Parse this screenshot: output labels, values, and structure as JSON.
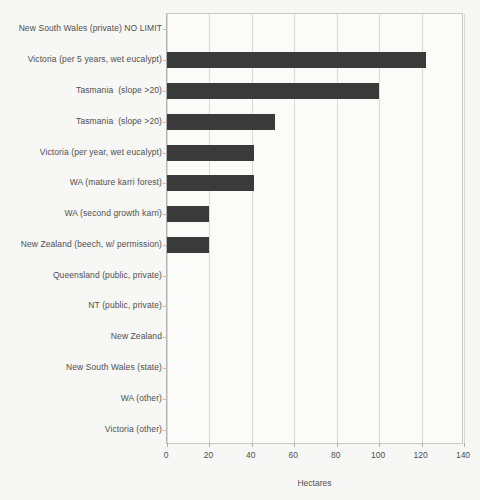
{
  "chart_data": {
    "type": "bar",
    "orientation": "horizontal",
    "title": "",
    "xlabel": "Hectares",
    "ylabel": "",
    "xlim": [
      0,
      140
    ],
    "xticks": [
      "0",
      "20",
      "40",
      "60",
      "80",
      "100",
      "120",
      "140"
    ],
    "xtick_step": 20,
    "grid": "vertical",
    "legend": "none",
    "bar_color": "#3a3a3a",
    "background_color": "#f7f7f5",
    "grid_color": "#d8d8d5",
    "axis_color": "#b4b4b0",
    "categories": [
      "New South Wales (private) NO LIMIT",
      "Victoria (per 5 years, wet eucalypt)",
      "Tasmania  (slope >20)",
      "Tasmania  (slope >20)",
      "Victoria (per year, wet eucalypt)",
      "WA (mature karri forest)",
      "WA (second growth karri)",
      "New Zealand (beech, w/ permission)",
      "Queensland (public, private)",
      "NT (public, private)",
      "New Zealand",
      "New South Wales (state)",
      "WA (other)",
      "Victoria (other)"
    ],
    "values": [
      0,
      122,
      100,
      51,
      41,
      41,
      20,
      20,
      0,
      0,
      0,
      0,
      0,
      0
    ]
  }
}
